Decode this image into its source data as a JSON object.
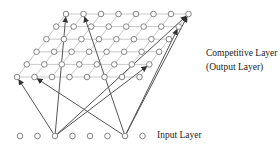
{
  "diagram": {
    "competitive_layer": {
      "label_line1": "Competitive Layer",
      "label_line2": "(Output Layer)",
      "rows": 6,
      "cols": 8
    },
    "input_layer": {
      "label": "Input Layer",
      "nodes": 8
    },
    "connections": [
      {
        "from_input": 2,
        "to_row": 5,
        "to_col": 0
      },
      {
        "from_input": 2,
        "to_row": 0,
        "to_col": 0
      },
      {
        "from_input": 2,
        "to_row": 0,
        "to_col": 7
      },
      {
        "from_input": 2,
        "to_row": 4,
        "to_col": 7
      },
      {
        "from_input": 6,
        "to_row": 5,
        "to_col": 1
      },
      {
        "from_input": 6,
        "to_row": 0,
        "to_col": 1
      },
      {
        "from_input": 6,
        "to_row": 0,
        "to_col": 7
      },
      {
        "from_input": 6,
        "to_row": 1,
        "to_col": 7
      }
    ],
    "colors": {
      "node": "#777777",
      "grid": "#bbbbbb",
      "arrow": "#555555"
    }
  }
}
